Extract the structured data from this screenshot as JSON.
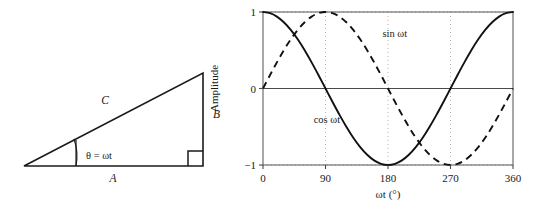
{
  "figure": {
    "background_color": "#ffffff",
    "line_color": "#1a1a1a",
    "grid_color": "#b9b2ae"
  },
  "triangle_diagram": {
    "name": "right-triangle-phasor-diagram",
    "labels": {
      "hypotenuse": "C",
      "vertical_side": "B",
      "horizontal_side": "A",
      "angle": "θ = ωt"
    },
    "right_angle_marker": "right-angle-square",
    "vertices": {
      "left": [
        24,
        166
      ],
      "bottom_right": [
        203,
        166
      ],
      "top_right": [
        203,
        73
      ]
    }
  },
  "chart_data": {
    "type": "line",
    "title": "",
    "xlabel": "ωt (°)",
    "ylabel": "Amplitude",
    "xlim": [
      0,
      360
    ],
    "ylim": [
      -1,
      1
    ],
    "xticks": [
      0,
      90,
      180,
      270,
      360
    ],
    "xtick_labels": [
      "0",
      "90",
      "180",
      "270",
      "360"
    ],
    "yticks": [
      -1,
      0,
      1
    ],
    "ytick_labels": [
      "−1",
      "0",
      "1"
    ],
    "grid": {
      "vertical_dotted_at": [
        90,
        180,
        270
      ],
      "horizontal_dotted_at": [
        1,
        -1
      ],
      "horizontal_solid_at": [
        0
      ]
    },
    "legend_position": "inline-annotations",
    "series": [
      {
        "name": "cos ωt",
        "style": "solid",
        "label": "cos ωt",
        "label_x": 73,
        "label_y": -0.45,
        "x": [
          0,
          10,
          20,
          30,
          40,
          50,
          60,
          70,
          80,
          90,
          100,
          110,
          120,
          130,
          140,
          150,
          160,
          170,
          180,
          190,
          200,
          210,
          220,
          230,
          240,
          250,
          260,
          270,
          280,
          290,
          300,
          310,
          320,
          330,
          340,
          350,
          360
        ],
        "values": [
          1.0,
          0.985,
          0.94,
          0.866,
          0.766,
          0.643,
          0.5,
          0.342,
          0.174,
          0.0,
          -0.174,
          -0.342,
          -0.5,
          -0.643,
          -0.766,
          -0.866,
          -0.94,
          -0.985,
          -1.0,
          -0.985,
          -0.94,
          -0.866,
          -0.766,
          -0.643,
          -0.5,
          -0.342,
          -0.174,
          0.0,
          0.174,
          0.342,
          0.5,
          0.643,
          0.766,
          0.866,
          0.94,
          0.985,
          1.0
        ]
      },
      {
        "name": "sin ωt",
        "style": "dashed",
        "label": "sin ωt",
        "label_x": 172,
        "label_y": 0.67,
        "x": [
          0,
          10,
          20,
          30,
          40,
          50,
          60,
          70,
          80,
          90,
          100,
          110,
          120,
          130,
          140,
          150,
          160,
          170,
          180,
          190,
          200,
          210,
          220,
          230,
          240,
          250,
          260,
          270,
          280,
          290,
          300,
          310,
          320,
          330,
          340,
          350,
          360
        ],
        "values": [
          0.0,
          0.174,
          0.342,
          0.5,
          0.643,
          0.766,
          0.866,
          0.94,
          0.985,
          1.0,
          0.985,
          0.94,
          0.866,
          0.766,
          0.643,
          0.5,
          0.342,
          0.174,
          0.0,
          -0.174,
          -0.342,
          -0.5,
          -0.643,
          -0.766,
          -0.866,
          -0.94,
          -0.985,
          -1.0,
          -0.985,
          -0.94,
          -0.866,
          -0.766,
          -0.643,
          -0.5,
          -0.342,
          -0.174,
          0.0
        ]
      }
    ]
  }
}
